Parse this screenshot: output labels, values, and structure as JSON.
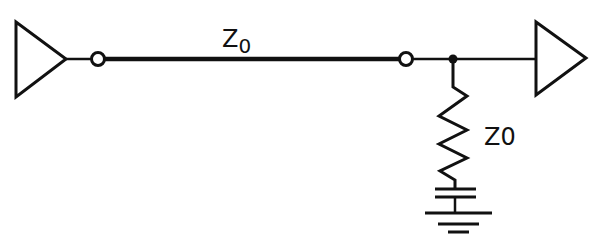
{
  "diagram": {
    "type": "circuit-schematic",
    "colors": {
      "stroke": "#111111",
      "background": "#ffffff"
    },
    "labels": {
      "line_impedance_main": "Z",
      "line_impedance_sub": "0",
      "termination_impedance": "Z0"
    },
    "components": [
      {
        "id": "driver",
        "kind": "buffer-triangle"
      },
      {
        "id": "source-node",
        "kind": "open-circle"
      },
      {
        "id": "transmission-line",
        "kind": "thick-line",
        "label": "Z0"
      },
      {
        "id": "load-node",
        "kind": "open-circle"
      },
      {
        "id": "junction",
        "kind": "filled-dot"
      },
      {
        "id": "receiver",
        "kind": "buffer-triangle"
      },
      {
        "id": "termination-resistor",
        "kind": "resistor",
        "label": "Z0"
      },
      {
        "id": "capacitor",
        "kind": "capacitor"
      },
      {
        "id": "ground",
        "kind": "ground-symbol"
      }
    ]
  }
}
